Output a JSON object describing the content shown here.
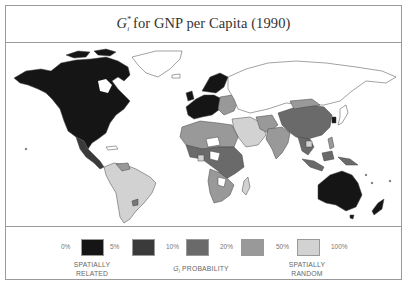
{
  "title": {
    "symbol": "G",
    "superscript": "*",
    "subscript": "i",
    "text": " for GNP per Capita (1990)"
  },
  "legend": {
    "ticks": [
      "0%",
      "5%",
      "10%",
      "20%",
      "50%",
      "100%"
    ],
    "classes": [
      {
        "range": "0%–5%",
        "color": "#151515"
      },
      {
        "range": "5%–10%",
        "color": "#3a3a3a"
      },
      {
        "range": "10%–20%",
        "color": "#6a6a6a"
      },
      {
        "range": "20%–50%",
        "color": "#999999"
      },
      {
        "range": "50%–100%",
        "color": "#d2d2d2"
      }
    ],
    "left_caption_line1": "SPATIALLY",
    "left_caption_line2": "RELATED",
    "center_caption": "G",
    "center_caption_sub": "i",
    "center_caption_rest": " PROBABILITY",
    "right_caption_line1": "SPATIALLY",
    "right_caption_line2": "RANDOM"
  },
  "map": {
    "regions": [
      {
        "name": "North America (USA, Canada)",
        "class": "0%–5%"
      },
      {
        "name": "Mexico / Central America",
        "class": "5%–10%"
      },
      {
        "name": "Greenland",
        "class": "none"
      },
      {
        "name": "Western Europe",
        "class": "0%–5%"
      },
      {
        "name": "Scandinavia",
        "class": "0%–5%"
      },
      {
        "name": "Eastern Europe",
        "class": "20%–50%"
      },
      {
        "name": "USSR",
        "class": "none"
      },
      {
        "name": "China",
        "class": "10%–20%"
      },
      {
        "name": "Mongolia",
        "class": "20%–50%"
      },
      {
        "name": "Japan",
        "class": "none"
      },
      {
        "name": "South Korea",
        "class": "0%–5%"
      },
      {
        "name": "India",
        "class": "20%–50%"
      },
      {
        "name": "Southeast Asia",
        "class": "10%–20%"
      },
      {
        "name": "Indonesia",
        "class": "10%–20%"
      },
      {
        "name": "Australia",
        "class": "0%–5%"
      },
      {
        "name": "New Zealand",
        "class": "0%–5%"
      },
      {
        "name": "South America",
        "class": "50%–100%"
      },
      {
        "name": "Venezuela",
        "class": "20%–50%"
      },
      {
        "name": "Uruguay",
        "class": "20%–50%"
      },
      {
        "name": "North Africa",
        "class": "20%–50%"
      },
      {
        "name": "Central Africa",
        "class": "10%–20%"
      },
      {
        "name": "Southern Africa",
        "class": "20%–50%"
      },
      {
        "name": "Madagascar",
        "class": "50%–100%"
      },
      {
        "name": "Middle East",
        "class": "50%–100%"
      }
    ]
  }
}
